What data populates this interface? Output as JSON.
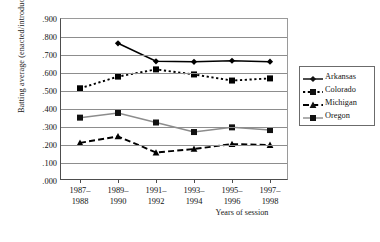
{
  "chart_data": {
    "type": "line",
    "title": "",
    "xlabel": "Years of session",
    "ylabel": "Batting average (enacted/introduced)",
    "categories": [
      "1987–\n1988",
      "1989–\n1990",
      "1991–\n1992",
      "1993–\n1994",
      "1995–\n1996",
      "1997–\n1998"
    ],
    "category_lines": [
      [
        "1987–",
        "1988"
      ],
      [
        "1989–",
        "1990"
      ],
      [
        "1991–",
        "1992"
      ],
      [
        "1993–",
        "1994"
      ],
      [
        "1995–",
        "1996"
      ],
      [
        "1997–",
        "1998"
      ]
    ],
    "ylim": [
      0.0,
      0.9
    ],
    "ytick_labels": [
      ".900",
      ".800",
      ".700",
      ".600",
      ".500",
      ".400",
      ".300",
      ".200",
      ".100",
      ".000"
    ],
    "ytick_values": [
      0.9,
      0.8,
      0.7,
      0.6,
      0.5,
      0.4,
      0.3,
      0.2,
      0.1,
      0.0
    ],
    "grid": true,
    "legend_position": "right",
    "series": [
      {
        "name": "Arkansas",
        "marker": "diamond",
        "line_style": "solid",
        "color": "#000000",
        "values": [
          null,
          0.765,
          0.665,
          0.662,
          0.668,
          0.663
        ]
      },
      {
        "name": "Colorado",
        "marker": "square",
        "line_style": "dotted",
        "color": "#000000",
        "values": [
          0.515,
          0.58,
          0.62,
          0.592,
          0.558,
          0.57
        ]
      },
      {
        "name": "Michigan",
        "marker": "triangle",
        "line_style": "dashed",
        "color": "#000000",
        "values": [
          0.212,
          0.248,
          0.158,
          0.178,
          0.205,
          0.2
        ]
      },
      {
        "name": "Oregon",
        "marker": "square",
        "line_style": "solid",
        "color": "#8c8c8c",
        "values": [
          0.352,
          0.378,
          0.325,
          0.272,
          0.298,
          0.283
        ]
      }
    ]
  }
}
